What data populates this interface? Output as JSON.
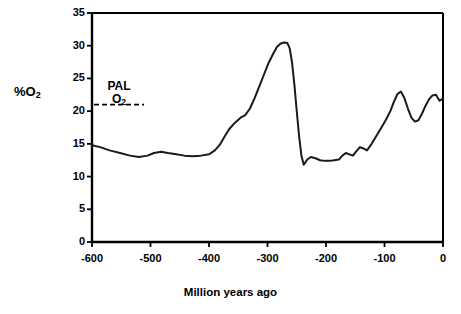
{
  "chart_data": {
    "type": "line",
    "title": "",
    "xlabel": "Million years ago",
    "ylabel": "%O2",
    "ylabel_display": "%O",
    "ylabel_sub": "2",
    "xlim": [
      -600,
      0
    ],
    "ylim": [
      0,
      35
    ],
    "grid": false,
    "legend": "none",
    "xticks": [
      "-600",
      "-500",
      "-400",
      "-300",
      "-200",
      "-100",
      "0"
    ],
    "xtick_values": [
      -600,
      -500,
      -400,
      -300,
      -200,
      -100,
      0
    ],
    "yticks": [
      "0",
      "5",
      "10",
      "15",
      "20",
      "25",
      "30",
      "35"
    ],
    "ytick_values": [
      0,
      5,
      10,
      15,
      20,
      25,
      30,
      35
    ],
    "line_color": "#1a1a1a",
    "line_width": 2.0,
    "annotations": [
      {
        "name": "pal-o2-reference",
        "numerator": "PAL",
        "denominator": "O",
        "denominator_sub": "2",
        "value": 21,
        "style": "dashed-horizontal-line"
      }
    ],
    "series": [
      {
        "name": "Atmospheric oxygen",
        "x": [
          -600,
          -586,
          -570,
          -552,
          -535,
          -520,
          -505,
          -494,
          -482,
          -470,
          -456,
          -442,
          -428,
          -414,
          -400,
          -390,
          -382,
          -374,
          -366,
          -356,
          -346,
          -338,
          -330,
          -322,
          -314,
          -306,
          -298,
          -290,
          -284,
          -278,
          -272,
          -266,
          -262,
          -258,
          -254,
          -250,
          -246,
          -242,
          -238,
          -232,
          -226,
          -218,
          -210,
          -202,
          -194,
          -186,
          -178,
          -172,
          -166,
          -160,
          -154,
          -148,
          -142,
          -136,
          -130,
          -122,
          -114,
          -106,
          -98,
          -90,
          -84,
          -78,
          -72,
          -66,
          -60,
          -54,
          -48,
          -42,
          -36,
          -30,
          -24,
          -18,
          -12,
          -6,
          0
        ],
        "y": [
          14.8,
          14.5,
          14.0,
          13.6,
          13.2,
          13.0,
          13.2,
          13.6,
          13.8,
          13.6,
          13.4,
          13.2,
          13.1,
          13.2,
          13.4,
          14.0,
          14.8,
          16.0,
          17.2,
          18.2,
          19.0,
          19.4,
          20.4,
          22.0,
          23.8,
          25.6,
          27.4,
          28.8,
          29.8,
          30.3,
          30.5,
          30.4,
          29.6,
          27.4,
          24.0,
          20.0,
          16.2,
          13.2,
          11.8,
          12.6,
          13.0,
          12.8,
          12.5,
          12.4,
          12.4,
          12.5,
          12.6,
          13.2,
          13.6,
          13.4,
          13.2,
          13.9,
          14.5,
          14.3,
          14.0,
          15.0,
          16.2,
          17.4,
          18.6,
          20.0,
          21.4,
          22.6,
          23.0,
          22.0,
          20.4,
          19.0,
          18.4,
          18.6,
          19.6,
          20.8,
          21.8,
          22.4,
          22.5,
          21.6,
          21.9
        ]
      }
    ]
  },
  "plot_frame": {
    "left": 92,
    "top": 13,
    "right": 443,
    "bottom": 242
  }
}
